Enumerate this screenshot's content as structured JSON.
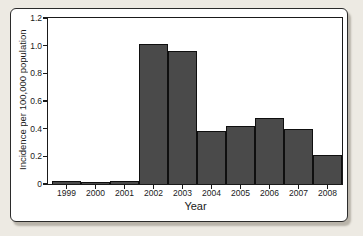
{
  "colors": {
    "page-bg": "#edeae3",
    "frame-bg": "#ffffff",
    "frame-border": "#2b2b2b",
    "axis": "#1a1a1a",
    "bar-fill": "#4a4a4a",
    "bar-border": "#0f0f0f",
    "text": "#1a1a1a",
    "shadow": "#b9b4aa"
  },
  "chart_data": {
    "type": "bar",
    "title": "",
    "categories": [
      "1999",
      "2000",
      "2001",
      "2002",
      "2003",
      "2004",
      "2005",
      "2006",
      "2007",
      "2008"
    ],
    "values": [
      0.02,
      0.01,
      0.02,
      1.01,
      0.96,
      0.38,
      0.42,
      0.48,
      0.4,
      0.21
    ],
    "xlabel": "Year",
    "ylabel": "Incidence per 100,000 population",
    "ylim": [
      0,
      1.2
    ],
    "yticks": [
      0,
      0.2,
      0.4,
      0.6,
      0.8,
      1.0,
      1.2
    ],
    "ytick_labels": [
      "0",
      "0.2",
      "0.4",
      "0.6",
      "0.8",
      "1.0",
      "1.2"
    ],
    "grid": false,
    "legend": "none",
    "bar_outline": true,
    "bars_touching": true
  }
}
